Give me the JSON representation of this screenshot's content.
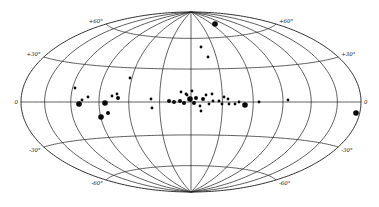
{
  "chart_data": {
    "type": "scatter",
    "title": "",
    "projection": "Hammer-Aitoff equal-area all-sky",
    "xlabel": "",
    "ylabel": "",
    "grid": true,
    "longitude_meridians_deg": [
      -180,
      -150,
      -120,
      -90,
      -60,
      -30,
      0,
      30,
      60,
      90,
      120,
      150,
      180
    ],
    "latitude_parallels_deg": [
      -60,
      -30,
      0,
      30,
      60
    ],
    "latitude_labels": [
      {
        "text": "+60°",
        "side": "left",
        "lat": 60
      },
      {
        "text": "+60°",
        "side": "right",
        "lat": 60
      },
      {
        "text": "+30°",
        "side": "left",
        "lat": 30
      },
      {
        "text": "+30°",
        "side": "right",
        "lat": 30
      },
      {
        "text": "0",
        "side": "left",
        "lat": 0
      },
      {
        "text": "0",
        "side": "right",
        "lat": 0
      },
      {
        "text": "-30°",
        "side": "left",
        "lat": -30
      },
      {
        "text": "-30°",
        "side": "right",
        "lat": -30
      },
      {
        "text": "-60°",
        "side": "left",
        "lat": -60
      },
      {
        "text": "-60°",
        "side": "right",
        "lat": -60
      }
    ],
    "points_px": [
      {
        "x": 75,
        "y": 88,
        "size": "small"
      },
      {
        "x": 82,
        "y": 100,
        "size": "small"
      },
      {
        "x": 88,
        "y": 97,
        "size": "small"
      },
      {
        "x": 79,
        "y": 104,
        "size": "large"
      },
      {
        "x": 105,
        "y": 103,
        "size": "large"
      },
      {
        "x": 108,
        "y": 113,
        "size": "medium"
      },
      {
        "x": 101,
        "y": 117,
        "size": "large"
      },
      {
        "x": 112,
        "y": 96,
        "size": "small"
      },
      {
        "x": 117,
        "y": 94,
        "size": "small"
      },
      {
        "x": 118,
        "y": 98,
        "size": "medium"
      },
      {
        "x": 130,
        "y": 78,
        "size": "small"
      },
      {
        "x": 151,
        "y": 99,
        "size": "small"
      },
      {
        "x": 152,
        "y": 108,
        "size": "small"
      },
      {
        "x": 169,
        "y": 101,
        "size": "medium"
      },
      {
        "x": 174,
        "y": 102,
        "size": "medium"
      },
      {
        "x": 180,
        "y": 101,
        "size": "medium"
      },
      {
        "x": 184,
        "y": 103,
        "size": "medium"
      },
      {
        "x": 190,
        "y": 99,
        "size": "large"
      },
      {
        "x": 194,
        "y": 103,
        "size": "medium"
      },
      {
        "x": 196,
        "y": 98,
        "size": "medium"
      },
      {
        "x": 187,
        "y": 95,
        "size": "small"
      },
      {
        "x": 181,
        "y": 92,
        "size": "small"
      },
      {
        "x": 186,
        "y": 94,
        "size": "small"
      },
      {
        "x": 192,
        "y": 91,
        "size": "small"
      },
      {
        "x": 200,
        "y": 106,
        "size": "small"
      },
      {
        "x": 203,
        "y": 99,
        "size": "medium"
      },
      {
        "x": 206,
        "y": 95,
        "size": "small"
      },
      {
        "x": 212,
        "y": 94,
        "size": "small"
      },
      {
        "x": 213,
        "y": 101,
        "size": "small"
      },
      {
        "x": 201,
        "y": 111,
        "size": "small"
      },
      {
        "x": 209,
        "y": 104,
        "size": "small"
      },
      {
        "x": 219,
        "y": 101,
        "size": "small"
      },
      {
        "x": 224,
        "y": 97,
        "size": "small"
      },
      {
        "x": 228,
        "y": 99,
        "size": "small"
      },
      {
        "x": 222,
        "y": 104,
        "size": "small"
      },
      {
        "x": 229,
        "y": 104,
        "size": "small"
      },
      {
        "x": 235,
        "y": 104,
        "size": "small"
      },
      {
        "x": 239,
        "y": 102,
        "size": "small"
      },
      {
        "x": 245,
        "y": 105,
        "size": "large"
      },
      {
        "x": 259,
        "y": 102,
        "size": "small"
      },
      {
        "x": 288,
        "y": 100,
        "size": "small"
      },
      {
        "x": 215,
        "y": 24,
        "size": "large"
      },
      {
        "x": 201,
        "y": 47,
        "size": "small"
      },
      {
        "x": 208,
        "y": 57,
        "size": "small"
      },
      {
        "x": 356,
        "y": 113,
        "size": "large"
      }
    ],
    "dot_radius_px": {
      "small": 1.4,
      "medium": 2.0,
      "large": 2.8
    },
    "ellipse_px": {
      "cx": 191,
      "cy": 102,
      "a": 170,
      "b": 90
    },
    "colors": {
      "line": "#2a2a2a",
      "dot": "#0a0a0a",
      "background": "#ffffff"
    }
  }
}
